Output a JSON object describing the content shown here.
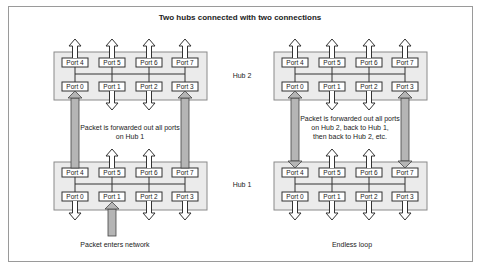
{
  "title": "Two hubs connected with two connections",
  "colors": {
    "hub_fill": "#ebebeb",
    "hub_border": "#8a8a8a",
    "port_fill": "#ffffff",
    "port_border": "#333333",
    "packet_arrow": "#b5b5b5",
    "white_arrow": "#ffffff"
  },
  "left_diagram": {
    "top_hub": {
      "top_ports": [
        "Port 4",
        "Port 5",
        "Port 6",
        "Port 7"
      ],
      "bottom_ports": [
        "Port 0",
        "Port 1",
        "Port 2",
        "Port 3"
      ]
    },
    "bottom_hub": {
      "top_ports": [
        "Port 4",
        "Port 5",
        "Port 6",
        "Port 7"
      ],
      "bottom_ports": [
        "Port 0",
        "Port 1",
        "Port 2",
        "Port 3"
      ]
    },
    "annotation_lines": [
      "Packet is forwarded out all ports",
      "on Hub 1"
    ],
    "caption": "Packet enters network"
  },
  "right_diagram": {
    "top_hub": {
      "top_ports": [
        "Port 4",
        "Port 5",
        "Port 6",
        "Port 7"
      ],
      "bottom_ports": [
        "Port 0",
        "Port 1",
        "Port 2",
        "Port 3"
      ]
    },
    "bottom_hub": {
      "top_ports": [
        "Port 4",
        "Port 5",
        "Port 6",
        "Port 7"
      ],
      "bottom_ports": [
        "Port 0",
        "Port 1",
        "Port 2",
        "Port 3"
      ]
    },
    "annotation_lines": [
      "Packet is forwarded out all ports",
      "on Hub 2, back to Hub 1,",
      "then back to Hub 2, etc."
    ],
    "caption": "Endless loop"
  },
  "hub_labels": {
    "top": "Hub 2",
    "bottom": "Hub 1"
  }
}
